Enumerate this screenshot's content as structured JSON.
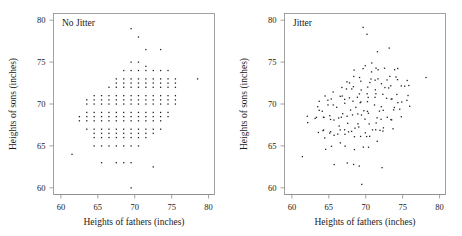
{
  "figure": {
    "background": "#ffffff",
    "point_color": "#232323",
    "axis_color": "#8a8a8a"
  },
  "chart_data": [
    {
      "type": "scatter",
      "title": "No Jitter",
      "xlabel": "Heights of fathers (inches)",
      "ylabel": "Heights of sons (inches)",
      "xlim": [
        59.0,
        80.8
      ],
      "ylim": [
        59.2,
        80.8
      ],
      "xticks": [
        60,
        65,
        70,
        75,
        80
      ],
      "yticks": [
        60,
        65,
        70,
        75,
        80
      ],
      "grid": false,
      "legend": "none",
      "note": "Father/son heights rounded to discrete values, producing overplotted lattice pattern",
      "x": [
        69.5,
        70.5,
        71.5,
        73.5,
        74.5,
        69.5,
        70.5,
        71.5,
        68.5,
        69.5,
        70.5,
        71.5,
        72.5,
        73.5,
        67.5,
        68.5,
        69.5,
        70.5,
        71.5,
        72.5,
        73.5,
        74.5,
        75.5,
        78.5,
        67.5,
        68.5,
        69.5,
        70.5,
        71.5,
        72.5,
        73.5,
        74.5,
        75.5,
        66.5,
        67.5,
        68.5,
        69.5,
        70.5,
        71.5,
        72.5,
        73.5,
        74.5,
        75.5,
        64.5,
        65.5,
        66.5,
        67.5,
        68.5,
        69.5,
        70.5,
        71.5,
        72.5,
        73.5,
        74.5,
        75.5,
        63.5,
        64.5,
        65.5,
        66.5,
        67.5,
        68.5,
        69.5,
        70.5,
        71.5,
        72.5,
        73.5,
        74.5,
        75.5,
        63.5,
        64.5,
        65.5,
        66.5,
        67.5,
        68.5,
        69.5,
        70.5,
        71.5,
        72.5,
        73.5,
        74.5,
        75.5,
        63.5,
        64.5,
        65.5,
        66.5,
        67.5,
        68.5,
        69.5,
        70.5,
        71.5,
        72.5,
        73.5,
        74.5,
        62.5,
        63.5,
        64.5,
        65.5,
        66.5,
        67.5,
        68.5,
        69.5,
        70.5,
        71.5,
        72.5,
        73.5,
        74.5,
        62.5,
        63.5,
        64.5,
        65.5,
        66.5,
        67.5,
        68.5,
        69.5,
        70.5,
        71.5,
        72.5,
        73.5,
        63.5,
        64.5,
        65.5,
        66.5,
        67.5,
        68.5,
        69.5,
        70.5,
        71.5,
        72.5,
        73.5,
        64.5,
        65.5,
        66.5,
        67.5,
        68.5,
        69.5,
        70.5,
        71.5,
        72.5,
        64.5,
        65.5,
        66.5,
        67.5,
        68.5,
        69.5,
        70.5,
        71.5,
        61.5,
        64.5,
        65.5,
        66.5,
        67.5,
        68.5,
        69.5,
        70.5,
        65.5,
        67.5,
        68.5,
        69.5,
        72.5,
        69.5
      ],
      "y": [
        79.0,
        78.0,
        76.5,
        76.5,
        74.0,
        75.0,
        75.0,
        74.5,
        74.0,
        74.0,
        74.0,
        74.0,
        74.0,
        74.0,
        73.0,
        73.0,
        73.0,
        73.0,
        73.0,
        73.0,
        73.0,
        73.0,
        73.0,
        73.0,
        72.5,
        72.5,
        72.5,
        72.5,
        72.5,
        72.5,
        72.5,
        72.5,
        72.5,
        72.0,
        72.0,
        72.0,
        72.0,
        72.0,
        72.0,
        72.0,
        72.0,
        72.0,
        72.0,
        71.0,
        71.0,
        71.0,
        71.0,
        71.0,
        71.0,
        71.0,
        71.0,
        71.0,
        71.0,
        71.0,
        71.0,
        70.5,
        70.5,
        70.5,
        70.5,
        70.5,
        70.5,
        70.5,
        70.5,
        70.5,
        70.5,
        70.5,
        70.5,
        70.5,
        70.0,
        70.0,
        70.0,
        70.0,
        70.0,
        70.0,
        70.0,
        70.0,
        70.0,
        70.0,
        70.0,
        70.0,
        70.0,
        69.0,
        69.0,
        69.0,
        69.0,
        69.0,
        69.0,
        69.0,
        69.0,
        69.0,
        69.0,
        69.0,
        69.0,
        68.5,
        68.5,
        68.5,
        68.5,
        68.5,
        68.5,
        68.5,
        68.5,
        68.5,
        68.5,
        68.5,
        68.5,
        68.5,
        68.0,
        68.0,
        68.0,
        68.0,
        68.0,
        68.0,
        68.0,
        68.0,
        68.0,
        68.0,
        68.0,
        68.0,
        67.0,
        67.0,
        67.0,
        67.0,
        67.0,
        67.0,
        67.0,
        67.0,
        67.0,
        67.0,
        67.0,
        66.5,
        66.5,
        66.5,
        66.5,
        66.5,
        66.5,
        66.5,
        66.5,
        66.5,
        66.0,
        66.0,
        66.0,
        66.0,
        66.0,
        66.0,
        66.0,
        66.0,
        64.0,
        65.0,
        65.0,
        65.0,
        65.0,
        65.0,
        65.0,
        65.0,
        63.0,
        63.0,
        63.0,
        63.0,
        62.5,
        60.0
      ]
    },
    {
      "type": "scatter",
      "title": "Jitter",
      "xlabel": "Heights of fathers (inches)",
      "ylabel": "Heights of sons (inches)",
      "xlim": [
        59.0,
        80.8
      ],
      "ylim": [
        59.2,
        80.8
      ],
      "xticks": [
        60,
        65,
        70,
        75,
        80
      ],
      "yticks": [
        60,
        65,
        70,
        75,
        80
      ],
      "grid": false,
      "legend": "none",
      "note": "Same data with small random jitter added to both coordinates to reveal overplotted density",
      "jitter_amount": 0.45
    }
  ]
}
